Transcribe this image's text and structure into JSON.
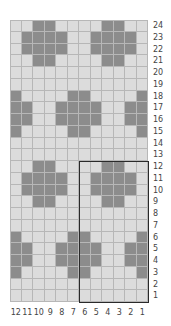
{
  "colors": {
    "light": "#dcdcdc",
    "dark": "#8c8c8c",
    "grid_line": "#b7b7b7",
    "repeat_box": "#2a2a2a",
    "label": "#444444"
  },
  "chart": {
    "columns": 12,
    "rows": 24,
    "column_labels": [
      "12",
      "11",
      "10",
      "9",
      "8",
      "7",
      "6",
      "5",
      "4",
      "3",
      "2",
      "1"
    ],
    "row_labels": [
      "24",
      "23",
      "22",
      "21",
      "20",
      "19",
      "18",
      "17",
      "16",
      "15",
      "14",
      "13",
      "12",
      "11",
      "10",
      "9",
      "8",
      "7",
      "6",
      "5",
      "4",
      "3",
      "2",
      "1"
    ],
    "pattern_top_to_bottom": [
      "..XX....XX..",
      ".XXXX..XXXX.",
      ".XXXX..XXXX.",
      "..XX....XX..",
      "............",
      "............",
      "X....XX....X",
      "XX..XXXX..XX",
      "XX..XXXX..XX",
      "X....XX....X",
      "............",
      "............",
      "..XX....XX..",
      ".XXXX..XXXX.",
      ".XXXX..XXXX.",
      "..XX....XX..",
      "............",
      "............",
      "X....XX....X",
      "XX..XXXX..XX",
      "XX..XXXX..XX",
      "X....XX....X",
      "............",
      "............"
    ],
    "legend": {
      "X": "dark (contrast color)",
      ".": "light (main color)"
    },
    "repeat_box": {
      "columns": "1-6",
      "rows": "1-12"
    }
  }
}
